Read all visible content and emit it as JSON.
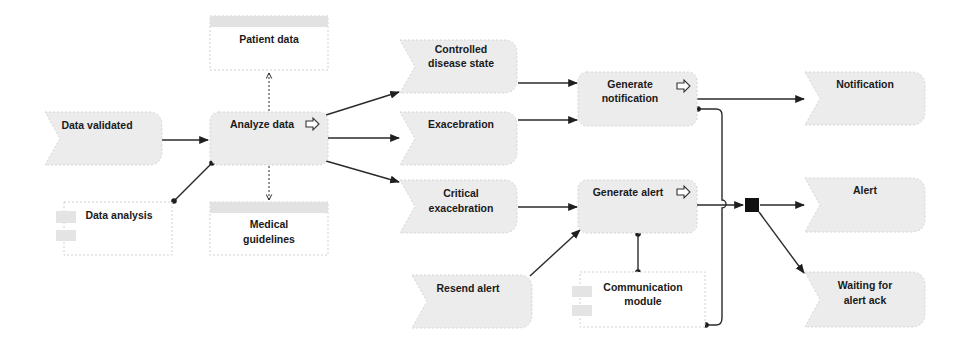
{
  "diagram": {
    "type": "EPC process diagram",
    "events": {
      "data_validated": "Data validated",
      "controlled_1": "Controlled",
      "controlled_2": "disease state",
      "exacebration": "Exacebration",
      "critical_1": "Critical",
      "critical_2": "exacebration",
      "resend_alert": "Resend alert",
      "notification": "Notification",
      "alert": "Alert",
      "waiting_1": "Waiting for",
      "waiting_2": "alert ack"
    },
    "functions": {
      "analyze_data": "Analyze data",
      "gen_notif_1": "Generate",
      "gen_notif_2": "notification",
      "generate_alert": "Generate alert"
    },
    "information_objects": {
      "patient_data": "Patient data",
      "medical_1": "Medical",
      "medical_2": "guidelines"
    },
    "org_units": {
      "data_analysis": "Data analysis",
      "comm_1": "Communication",
      "comm_2": "module"
    },
    "connector": "AND"
  }
}
